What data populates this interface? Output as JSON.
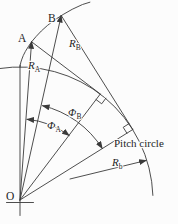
{
  "figure": {
    "kind": "involute-gear-geometry-diagram"
  },
  "labels": {
    "point_b": "B",
    "point_a": "A",
    "origin": "O",
    "radius_b": {
      "main": "R",
      "sub": "B"
    },
    "radius_a": {
      "main": "R",
      "sub": "A"
    },
    "base_radius": {
      "main": "R",
      "sub": "b"
    },
    "angle_a": {
      "main": "Φ",
      "sub": "A"
    },
    "angle_b": {
      "main": "Φ",
      "sub": "B"
    },
    "pitch_circle": "Pitch circle"
  },
  "colors": {
    "line": "#3a3a3a",
    "text": "#1e1e1e",
    "background": "#fcfcfc"
  }
}
